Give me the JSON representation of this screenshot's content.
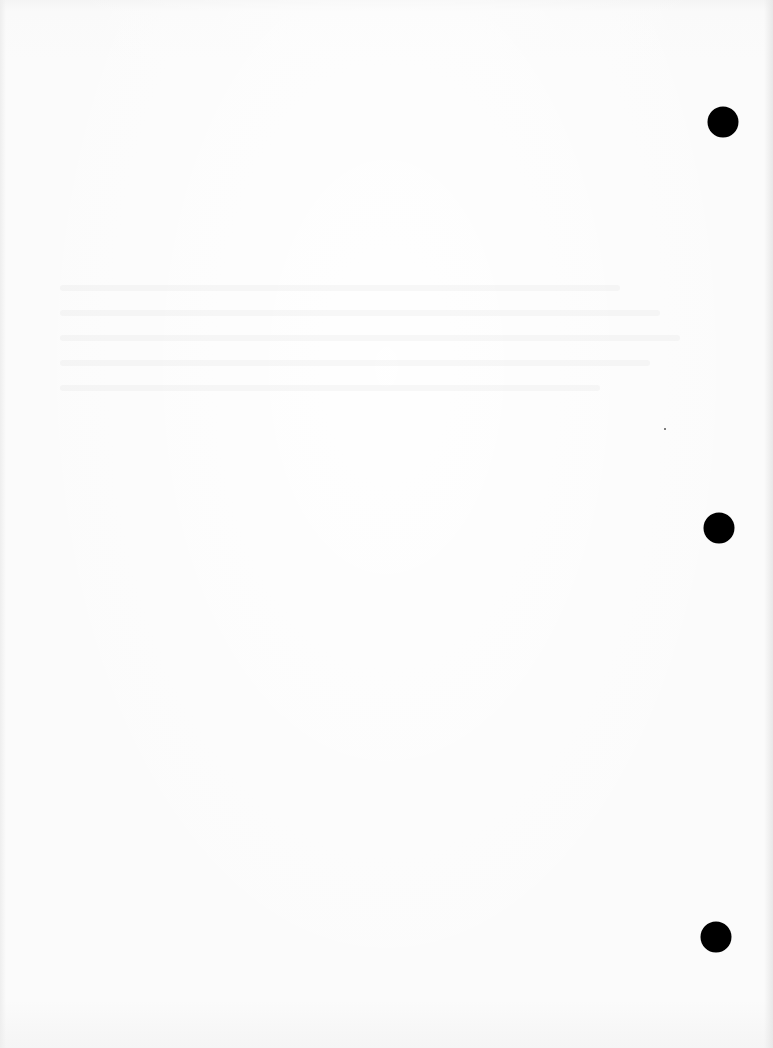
{
  "document": {
    "type": "scanned-page",
    "content": "",
    "paper_color": "#fbfbfb",
    "punch_hole_color": "#000000"
  },
  "punch_holes": [
    {
      "x": 723,
      "y": 122,
      "diameter": 31
    },
    {
      "x": 719,
      "y": 528,
      "diameter": 31
    },
    {
      "x": 716,
      "y": 937,
      "diameter": 31
    }
  ],
  "marks": [
    {
      "x": 664,
      "y": 428
    }
  ],
  "show_through_bands": [
    {
      "y": 285,
      "width": 560
    },
    {
      "y": 310,
      "width": 600
    },
    {
      "y": 335,
      "width": 620
    },
    {
      "y": 360,
      "width": 590
    },
    {
      "y": 385,
      "width": 540
    }
  ]
}
